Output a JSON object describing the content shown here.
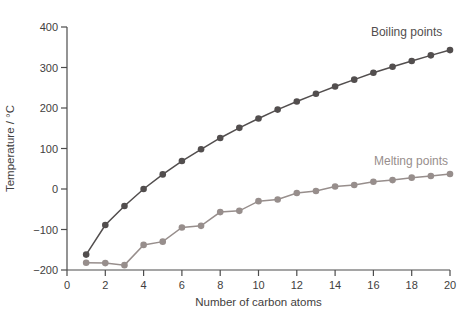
{
  "figure": {
    "background": "#ffffff"
  },
  "chart_data": {
    "type": "line",
    "title": "",
    "xlabel": "Number of carbon atoms",
    "ylabel": "Temperature / °C",
    "xlim": [
      0,
      20
    ],
    "ylim": [
      -200,
      400
    ],
    "x_ticks": [
      0,
      2,
      4,
      6,
      8,
      10,
      12,
      14,
      16,
      18,
      20
    ],
    "y_ticks": [
      400,
      300,
      200,
      100,
      0,
      -100,
      -200
    ],
    "grid": false,
    "legend": "inline-labels",
    "axis_color": "#4c4c4c",
    "text_color": "#3f3e40",
    "x": [
      1,
      2,
      3,
      4,
      5,
      6,
      7,
      8,
      9,
      10,
      11,
      12,
      13,
      14,
      15,
      16,
      17,
      18,
      19,
      20
    ],
    "series": [
      {
        "name": "Boiling points",
        "color": "#524e4e",
        "values": [
          -162,
          -89,
          -42,
          0,
          36,
          69,
          98,
          126,
          151,
          174,
          196,
          216,
          235,
          253,
          270,
          287,
          302,
          316,
          330,
          343
        ]
      },
      {
        "name": "Melting points",
        "color": "#978e8c",
        "values": [
          -182,
          -183,
          -188,
          -138,
          -130,
          -95,
          -91,
          -57,
          -54,
          -30,
          -26,
          -10,
          -5,
          6,
          10,
          18,
          22,
          28,
          32,
          37
        ]
      }
    ],
    "annotations": [
      {
        "text": "Boiling points",
        "x": 19.6,
        "y": 388,
        "anchor": "end",
        "color": "#524e4e"
      },
      {
        "text": "Melting points",
        "x": 19.9,
        "y": 68,
        "anchor": "end",
        "color": "#978e8c"
      }
    ]
  }
}
